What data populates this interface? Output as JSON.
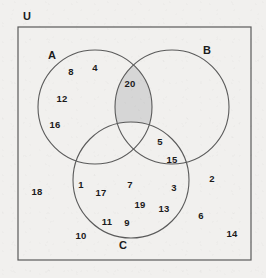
{
  "diagram": {
    "type": "venn-3-set",
    "universe_label": "U",
    "sets": [
      {
        "key": "A",
        "label": "A",
        "cx": 95,
        "cy": 107,
        "r": 57,
        "label_x": 52,
        "label_y": 55
      },
      {
        "key": "B",
        "label": "B",
        "cx": 172,
        "cy": 107,
        "r": 57,
        "label_x": 207,
        "label_y": 50
      },
      {
        "key": "C",
        "label": "C",
        "cx": 131,
        "cy": 180,
        "r": 58,
        "label_x": 123,
        "label_y": 245
      }
    ],
    "universe_box": {
      "x": 18,
      "y": 27,
      "width": 233,
      "height": 233
    },
    "universe_label_pos": {
      "x": 27,
      "y": 16
    },
    "shaded_region": {
      "name": "A-intersect-B-only",
      "color": "#d6d6d6",
      "description": "Elements in both A and B but not in C"
    },
    "stroke_color": "#5a5a5a",
    "text_color": "#1b1b1b",
    "background_color": "#f1f0ee",
    "elements": [
      {
        "value": "8",
        "x": 71,
        "y": 71,
        "region": "A-only"
      },
      {
        "value": "4",
        "x": 95,
        "y": 67,
        "region": "A-only"
      },
      {
        "value": "12",
        "x": 62,
        "y": 98,
        "region": "A-only"
      },
      {
        "value": "16",
        "x": 55,
        "y": 124,
        "region": "A-only"
      },
      {
        "value": "20",
        "x": 130,
        "y": 83,
        "region": "A-and-B-only"
      },
      {
        "value": "5",
        "x": 160,
        "y": 141,
        "region": "B-and-C-only"
      },
      {
        "value": "15",
        "x": 172,
        "y": 159,
        "region": "B-and-C-only"
      },
      {
        "value": "1",
        "x": 81,
        "y": 184,
        "region": "A-and-C-only"
      },
      {
        "value": "17",
        "x": 101,
        "y": 192,
        "region": "A-and-C-only"
      },
      {
        "value": "7",
        "x": 130,
        "y": 184,
        "region": "A-and-B-and-C"
      },
      {
        "value": "3",
        "x": 174,
        "y": 187,
        "region": "C-only"
      },
      {
        "value": "19",
        "x": 140,
        "y": 204,
        "region": "C-only"
      },
      {
        "value": "13",
        "x": 164,
        "y": 208,
        "region": "C-only"
      },
      {
        "value": "11",
        "x": 107,
        "y": 221,
        "region": "C-only"
      },
      {
        "value": "9",
        "x": 127,
        "y": 222,
        "region": "C-only"
      },
      {
        "value": "2",
        "x": 212,
        "y": 178,
        "region": "outside-all"
      },
      {
        "value": "18",
        "x": 37,
        "y": 191,
        "region": "outside-all"
      },
      {
        "value": "6",
        "x": 201,
        "y": 215,
        "region": "outside-all"
      },
      {
        "value": "10",
        "x": 81,
        "y": 235,
        "region": "outside-all"
      },
      {
        "value": "14",
        "x": 232,
        "y": 233,
        "region": "outside-all"
      }
    ]
  }
}
